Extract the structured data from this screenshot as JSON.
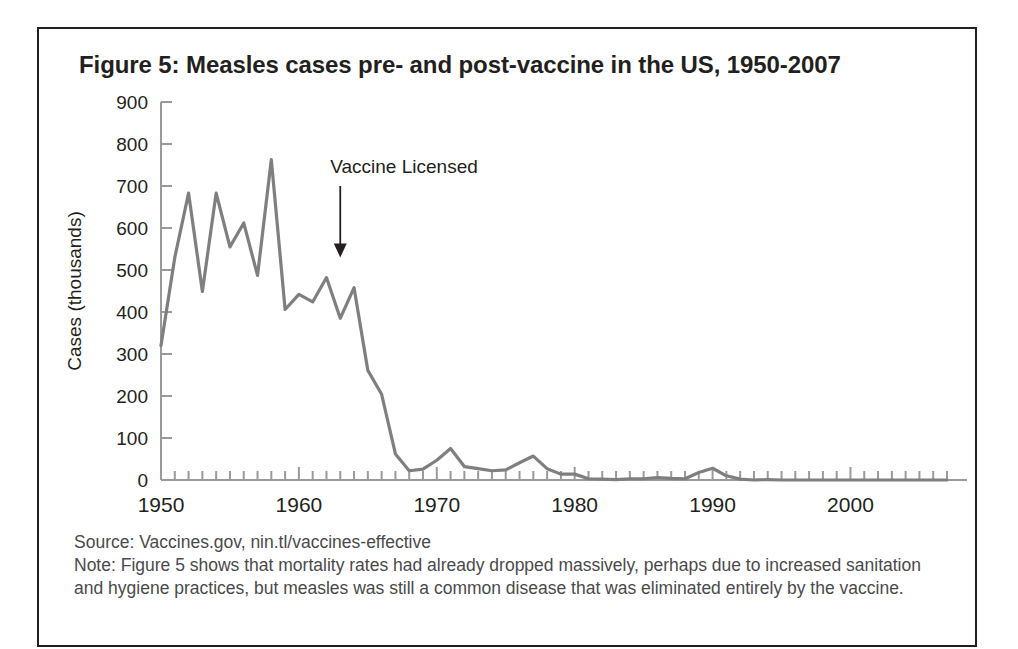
{
  "figure": {
    "title": "Figure 5: Measles cases pre- and post-vaccine in the US, 1950-2007",
    "source_line": "Source: Vaccines.gov, nin.tl/vaccines-effective",
    "note_line": "Note: Figure 5 shows that mortality rates had already dropped massively, perhaps due to increased sanitation and hygiene practices, but measles was still a common disease that was eliminated entirely by the vaccine."
  },
  "colors": {
    "frame": "#231f20",
    "line": "#7f7f7f",
    "axis": "#9a9a9a",
    "text": "#231f20",
    "caption_text": "#4a4a4a",
    "background": "#ffffff"
  },
  "chart_data": {
    "type": "line",
    "title": "Figure 5: Measles cases pre- and post-vaccine in the US, 1950-2007",
    "xlabel": "",
    "ylabel": "Cases (thousands)",
    "xlim": [
      1950,
      2007
    ],
    "ylim": [
      0,
      900
    ],
    "ytick_step": 100,
    "grid": false,
    "legend": "none",
    "yticks": [
      0,
      100,
      200,
      300,
      400,
      500,
      600,
      700,
      800,
      900
    ],
    "ytick_labels": [
      "0",
      "100",
      "200",
      "300",
      "400",
      "500",
      "600",
      "700",
      "800",
      "900"
    ],
    "xticks_labeled": [
      1950,
      1960,
      1970,
      1980,
      1990,
      2000
    ],
    "xtick_labels": [
      "1950",
      "1960",
      "1970",
      "1980",
      "1990",
      "2000"
    ],
    "xtick_minor_interval": 1,
    "x": [
      1950,
      1951,
      1952,
      1953,
      1954,
      1955,
      1956,
      1957,
      1958,
      1959,
      1960,
      1961,
      1962,
      1963,
      1964,
      1965,
      1966,
      1967,
      1968,
      1969,
      1970,
      1971,
      1972,
      1973,
      1974,
      1975,
      1976,
      1977,
      1978,
      1979,
      1980,
      1981,
      1982,
      1983,
      1984,
      1985,
      1986,
      1987,
      1988,
      1989,
      1990,
      1991,
      1992,
      1993,
      1994,
      1995,
      1996,
      1997,
      1998,
      1999,
      2000,
      2001,
      2002,
      2003,
      2004,
      2005,
      2006,
      2007
    ],
    "values": [
      320,
      530,
      683,
      449,
      683,
      555,
      612,
      487,
      763,
      406,
      442,
      424,
      482,
      385,
      458,
      261,
      204,
      62,
      22,
      26,
      47,
      75,
      32,
      27,
      22,
      24,
      41,
      57,
      27,
      14,
      14,
      3,
      2,
      1,
      3,
      3,
      6,
      4,
      3,
      18,
      28,
      10,
      2,
      0,
      1,
      0,
      0,
      0,
      0,
      0,
      0,
      0,
      0,
      0,
      0,
      0,
      0,
      0
    ],
    "series_name": "Measles cases (thousands)",
    "annotations": [
      {
        "text": "Vaccine Licensed",
        "x": 1963,
        "arrow": "down",
        "arrow_from_y": 700,
        "arrow_to_y": 530
      }
    ]
  }
}
